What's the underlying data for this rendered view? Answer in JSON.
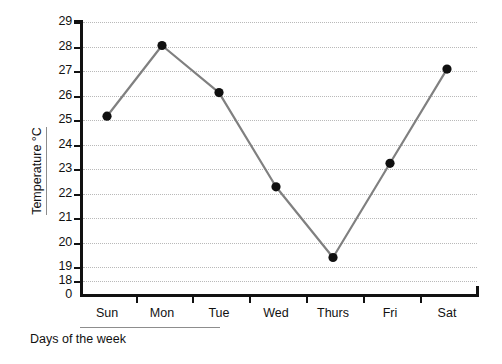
{
  "chart_data": {
    "type": "line",
    "title": "",
    "xlabel": "Days of the week",
    "ylabel": "Temperature  °C",
    "categories": [
      "Sun",
      "Mon",
      "Tue",
      "Wed",
      "Thurs",
      "Fri",
      "Sat"
    ],
    "values": [
      25,
      28,
      26,
      22,
      19,
      23,
      27
    ],
    "series": [
      {
        "name": "Temperature",
        "values": [
          25,
          28,
          26,
          22,
          19,
          23,
          27
        ]
      }
    ],
    "ytick_labels": [
      "29",
      "28",
      "27",
      "26",
      "25",
      "24",
      "23",
      "22",
      "21",
      "20",
      "19",
      "18",
      "0"
    ],
    "ytick_values": [
      29,
      28,
      27,
      26,
      25,
      24,
      23,
      22,
      21,
      20,
      19,
      18,
      0
    ],
    "ylim": [
      18,
      29
    ],
    "y_axis_break": true,
    "y_axis_origin_label": "0",
    "grid": true,
    "grid_style": "dotted-horizontal",
    "legend": "none",
    "marker": "filled-circle",
    "colors": {
      "line": "#808080",
      "marker": "#101010",
      "grid": "#b9b9b9",
      "axis": "#111111",
      "background": "#ffffff",
      "title_rule": "#8d8d8d"
    }
  }
}
